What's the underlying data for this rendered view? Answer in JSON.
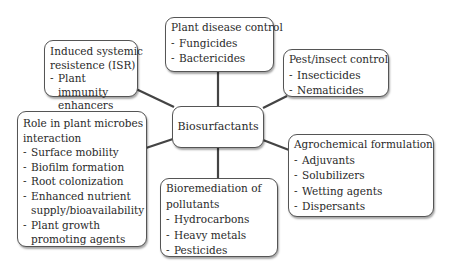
{
  "center": {
    "label": "Biosurfactants"
  },
  "nodes": {
    "disease": {
      "title": "Plant disease control",
      "items": [
        "Fungicides",
        "Bactericides"
      ]
    },
    "isr": {
      "title_line1": "Induced systemic",
      "title_line2": "resistence (ISR)",
      "items": [
        "Plant immunity enhancers"
      ]
    },
    "pest": {
      "title": "Pest/insect control",
      "items": [
        "Insecticides",
        "Nematicides"
      ]
    },
    "role": {
      "title_line1": "Role in plant microbes",
      "title_line2": "interaction",
      "items": [
        "Surface mobility",
        "Biofilm formation",
        "Root colonization",
        "Enhanced nutrient supply/bioavailability",
        "Plant growth promoting agents"
      ]
    },
    "agro": {
      "title": "Agrochemical formulation",
      "items": [
        "Adjuvants",
        "Solubilizers",
        "Wetting agents",
        "Dispersants"
      ]
    },
    "bio": {
      "title_line1": "Bioremediation of",
      "title_line2": "pollutants",
      "items": [
        "Hydrocarbons",
        "Heavy metals",
        "Pesticides"
      ]
    }
  },
  "colors": {
    "line": "#444444",
    "border": "#555555",
    "text": "#2a2a2a"
  }
}
